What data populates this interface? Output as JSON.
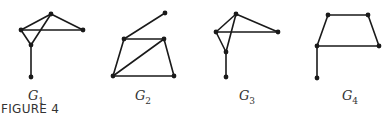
{
  "caption": "FIGURE 4",
  "graphs": [
    {
      "name": "G1",
      "label_main": "G",
      "label_sub": "1",
      "label_pos": [
        36,
        88
      ],
      "vertices": [
        [
          51,
          14
        ],
        [
          21,
          30
        ],
        [
          83,
          30
        ],
        [
          31,
          45
        ],
        [
          31,
          77
        ]
      ],
      "edges": [
        [
          0,
          1
        ],
        [
          0,
          2
        ],
        [
          1,
          2
        ],
        [
          1,
          3
        ],
        [
          0,
          3
        ],
        [
          3,
          4
        ]
      ]
    },
    {
      "name": "G2",
      "label_main": "G",
      "label_sub": "2",
      "label_pos": [
        143,
        88
      ],
      "vertices": [
        [
          165,
          13
        ],
        [
          124,
          39
        ],
        [
          164,
          39
        ],
        [
          113,
          76
        ],
        [
          174,
          76
        ]
      ],
      "edges": [
        [
          1,
          0
        ],
        [
          1,
          2
        ],
        [
          1,
          3
        ],
        [
          2,
          3
        ],
        [
          2,
          4
        ],
        [
          3,
          4
        ]
      ]
    },
    {
      "name": "G3",
      "label_main": "G",
      "label_sub": "3",
      "label_pos": [
        247,
        88
      ],
      "vertices": [
        [
          236,
          14
        ],
        [
          216,
          32
        ],
        [
          278,
          32
        ],
        [
          226,
          52
        ],
        [
          226,
          77
        ]
      ],
      "edges": [
        [
          0,
          1
        ],
        [
          0,
          2
        ],
        [
          1,
          2
        ],
        [
          1,
          3
        ],
        [
          0,
          3
        ],
        [
          3,
          4
        ]
      ]
    },
    {
      "name": "G4",
      "label_main": "G",
      "label_sub": "4",
      "label_pos": [
        350,
        88
      ],
      "vertices": [
        [
          328,
          15
        ],
        [
          368,
          15
        ],
        [
          317,
          46
        ],
        [
          379,
          46
        ],
        [
          317,
          78
        ]
      ],
      "edges": [
        [
          0,
          1
        ],
        [
          0,
          2
        ],
        [
          1,
          3
        ],
        [
          2,
          3
        ],
        [
          2,
          4
        ]
      ]
    }
  ]
}
